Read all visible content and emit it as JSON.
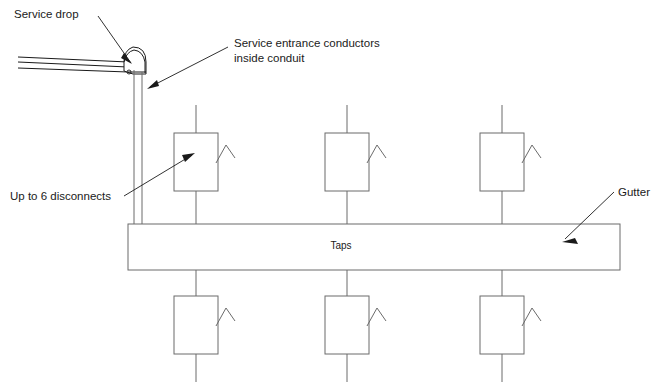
{
  "diagram": {
    "background_color": "#ffffff",
    "line_color": "#6b6b6b",
    "annotation_color": "#1a1a1a",
    "width": 663,
    "height": 388
  },
  "labels": {
    "service_drop": "Service drop",
    "service_entrance_line1": "Service entrance conductors",
    "service_entrance_line2": "inside conduit",
    "disconnects": "Up to 6 disconnects",
    "gutter": "Gutter",
    "taps": "Taps"
  },
  "components": {
    "gutter": {
      "label": "Taps",
      "x": 128,
      "y": 224,
      "width": 492,
      "height": 46
    },
    "disconnect_boxes": [
      {
        "id": "disconnect-top-1",
        "row": "top",
        "x": 174,
        "y": 133,
        "width": 44,
        "height": 58
      },
      {
        "id": "disconnect-top-2",
        "row": "top",
        "x": 325,
        "y": 133,
        "width": 44,
        "height": 58
      },
      {
        "id": "disconnect-top-3",
        "row": "top",
        "x": 480,
        "y": 133,
        "width": 44,
        "height": 58
      },
      {
        "id": "disconnect-bottom-1",
        "row": "bottom",
        "x": 174,
        "y": 296,
        "width": 44,
        "height": 58
      },
      {
        "id": "disconnect-bottom-2",
        "row": "bottom",
        "x": 325,
        "y": 296,
        "width": 44,
        "height": 58
      },
      {
        "id": "disconnect-bottom-3",
        "row": "bottom",
        "x": 480,
        "y": 296,
        "width": 44,
        "height": 58
      }
    ],
    "service_drop_conductors": 3,
    "conduit": {
      "orientation": "vertical",
      "x_left": 133,
      "x_right": 142,
      "y_top": 62,
      "y_bottom": 224
    },
    "service_head": {
      "cx": 139,
      "cy": 55
    }
  },
  "leaders": [
    {
      "id": "leader-service-drop",
      "from_label": "service_drop",
      "x1": 98,
      "y1": 16,
      "x2": 131,
      "y2": 63
    },
    {
      "id": "leader-service-entrance",
      "from_label": "service_entrance",
      "x1": 228,
      "y1": 47,
      "x2": 149,
      "y2": 88
    },
    {
      "id": "leader-disconnects",
      "from_label": "disconnects",
      "x1": 124,
      "y1": 196,
      "x2": 190,
      "y2": 155
    },
    {
      "id": "leader-gutter",
      "from_label": "gutter",
      "x1": 614,
      "y1": 192,
      "x2": 563,
      "y2": 240
    }
  ]
}
